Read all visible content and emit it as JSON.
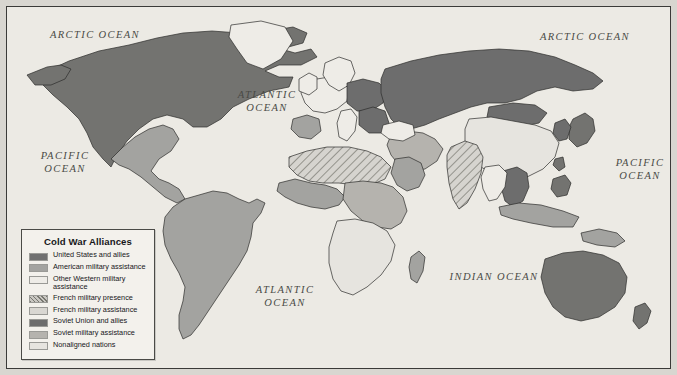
{
  "map": {
    "title": "Cold War Alliances",
    "ocean_labels": [
      {
        "name": "arctic-ocean-west",
        "text": "ARCTIC OCEAN",
        "x": 28,
        "y": 22,
        "w": 120
      },
      {
        "name": "arctic-ocean-east",
        "text": "ARCTIC OCEAN",
        "x": 518,
        "y": 24,
        "w": 120
      },
      {
        "name": "atlantic-ocean-north",
        "text": "ATLANTIC\nOCEAN",
        "x": 213,
        "y": 82,
        "w": 94
      },
      {
        "name": "pacific-ocean-west",
        "text": "PACIFIC\nOCEAN",
        "x": 22,
        "y": 143,
        "w": 72
      },
      {
        "name": "pacific-ocean-east",
        "text": "PACIFIC\nOCEAN",
        "x": 597,
        "y": 150,
        "w": 72
      },
      {
        "name": "atlantic-ocean-south",
        "text": "ATLANTIC\nOCEAN",
        "x": 234,
        "y": 277,
        "w": 88
      },
      {
        "name": "indian-ocean",
        "text": "INDIAN OCEAN",
        "x": 432,
        "y": 264,
        "w": 110
      }
    ],
    "legend": [
      {
        "label": "United States and allies",
        "color": "#707070",
        "pattern": "solid"
      },
      {
        "label": "American military assistance",
        "color": "#a3a3a0",
        "pattern": "solid"
      },
      {
        "label": "Other Western military assistance",
        "color": "#eeece7",
        "pattern": "solid"
      },
      {
        "label": "French military presence",
        "color": "#c9c7c2",
        "pattern": "hatch"
      },
      {
        "label": "French military assistance",
        "color": "#d9d7d2",
        "pattern": "solid"
      },
      {
        "label": "Soviet Union and allies",
        "color": "#6d6d6d",
        "pattern": "solid"
      },
      {
        "label": "Soviet military assistance",
        "color": "#b5b3ae",
        "pattern": "solid"
      },
      {
        "label": "Nonaligned nations",
        "color": "#e6e4df",
        "pattern": "solid"
      }
    ],
    "colors": {
      "ocean": "#eceae4",
      "us_allies": "#737370",
      "american_assistance": "#a3a3a0",
      "other_western": "#eeece7",
      "french_presence": "#c9c7c2",
      "french_assistance": "#d9d7d2",
      "soviet_allies": "#6d6d6d",
      "soviet_assistance": "#b5b3ae",
      "nonaligned": "#e6e4df",
      "border": "#3a3a38",
      "coast": "#2d2d2b"
    },
    "regions": [
      {
        "name": "north-america-usa-canada",
        "fill": "us_allies",
        "d": "M36 66 L62 54 L92 44 L122 38 L150 31 L176 26 L205 24 L232 26 L250 31 L262 24 L286 20 L300 26 L296 36 L274 42 L288 46 L304 42 L310 50 L294 58 L272 58 L258 64 L272 70 L286 70 L282 80 L262 84 L242 92 L226 100 L214 112 L200 120 L186 120 L176 112 L160 108 L146 112 L132 122 L120 134 L110 148 L104 160 L96 152 L86 140 L80 126 L72 112 L60 100 L46 88 L34 76 Z"
      },
      {
        "name": "alaska-panhandle",
        "fill": "us_allies",
        "d": "M20 68 L40 60 L54 58 L64 62 L58 72 L44 78 L28 78 Z"
      },
      {
        "name": "greenland",
        "fill": "other_western",
        "d": "M224 18 L254 14 L278 20 L286 34 L274 52 L256 62 L240 56 L230 42 L222 30 Z"
      },
      {
        "name": "mexico-centam",
        "fill": "american_assistance",
        "d": "M104 152 L116 140 L128 130 L142 122 L156 118 L166 122 L172 132 L164 144 L152 152 L144 164 L152 172 L162 176 L172 182 L178 192 L170 196 L158 190 L146 180 L134 170 L122 162 L112 158 Z"
      },
      {
        "name": "south-america",
        "fill": "american_assistance",
        "d": "M178 192 L192 188 L206 184 L220 186 L232 192 L242 196 L250 192 L258 196 L254 206 L246 216 L244 230 L240 244 L232 258 L224 270 L216 282 L208 294 L200 306 L192 318 L184 328 L176 332 L172 322 L172 308 L176 294 L178 280 L172 266 L164 252 L158 238 L156 224 L158 210 L166 200 Z"
      },
      {
        "name": "africa-north-hatched",
        "fill": "french_presence",
        "hatch": true,
        "d": "M282 150 L300 144 L320 140 L342 140 L360 144 L374 150 L384 160 L378 172 L364 178 L348 178 L332 176 L316 176 L302 174 L290 168 L282 160 Z"
      },
      {
        "name": "africa-west",
        "fill": "american_assistance",
        "d": "M272 176 L288 172 L304 176 L318 178 L330 182 L338 190 L332 198 L318 202 L304 200 L290 196 L278 190 L270 184 Z"
      },
      {
        "name": "africa-central-east",
        "fill": "soviet_assistance",
        "d": "M338 176 L356 174 L374 176 L386 180 L396 190 L400 204 L394 216 L384 222 L370 220 L356 214 L344 204 L336 192 Z"
      },
      {
        "name": "africa-south",
        "fill": "nonaligned",
        "d": "M330 214 L348 212 L366 216 L380 224 L388 238 L384 254 L374 268 L360 280 L346 288 L334 284 L326 272 L322 256 L322 240 L326 226 Z"
      },
      {
        "name": "madagascar",
        "fill": "american_assistance",
        "d": "M404 250 L412 244 L418 250 L416 264 L410 276 L404 272 L402 260 Z"
      },
      {
        "name": "europe-west",
        "fill": "other_western",
        "d": "M296 78 L310 72 L322 70 L334 74 L342 82 L340 94 L330 102 L318 106 L306 104 L298 96 L294 86 Z"
      },
      {
        "name": "iberia",
        "fill": "american_assistance",
        "d": "M286 112 L300 108 L312 112 L314 124 L304 132 L292 130 L284 122 Z"
      },
      {
        "name": "scandinavia",
        "fill": "other_western",
        "d": "M318 56 L332 50 L344 54 L348 66 L342 78 L332 84 L322 78 L316 68 Z"
      },
      {
        "name": "britain-ireland",
        "fill": "other_western",
        "d": "M292 72 L302 66 L310 70 L310 82 L302 88 L292 84 Z"
      },
      {
        "name": "central-europe-soviet-bloc",
        "fill": "soviet_allies",
        "d": "M340 76 L356 72 L372 76 L380 84 L376 96 L364 104 L350 104 L340 96 Z"
      },
      {
        "name": "balkans",
        "fill": "soviet_allies",
        "d": "M352 104 L366 100 L378 104 L382 116 L374 126 L362 126 L352 118 Z"
      },
      {
        "name": "italy",
        "fill": "other_western",
        "d": "M334 104 L344 102 L350 110 L348 124 L340 134 L332 130 L330 116 Z"
      },
      {
        "name": "soviet-union",
        "fill": "soviet_allies",
        "d": "M378 62 L404 54 L432 48 L462 44 L492 42 L522 44 L548 50 L568 58 L586 66 L596 74 L586 82 L566 84 L548 80 L530 84 L514 92 L498 96 L480 96 L464 100 L448 106 L432 112 L418 118 L404 122 L392 120 L384 112 L378 100 L374 86 L374 72 Z"
      },
      {
        "name": "mongolia",
        "fill": "soviet_allies",
        "d": "M482 100 L506 96 L528 98 L540 106 L532 116 L512 120 L492 118 L480 110 Z"
      },
      {
        "name": "china",
        "fill": "nonaligned",
        "d": "M462 112 L484 110 L506 114 L528 118 L544 124 L552 136 L548 150 L536 162 L520 170 L504 172 L488 168 L474 160 L464 148 L458 134 L458 122 Z"
      },
      {
        "name": "india-hatched",
        "fill": "french_presence",
        "hatch": true,
        "d": "M444 140 L458 134 L470 138 L476 150 L474 166 L468 182 L460 196 L452 202 L446 192 L442 176 L440 160 L440 148 Z"
      },
      {
        "name": "middle-east",
        "fill": "soviet_assistance",
        "d": "M384 128 L400 124 L416 126 L428 132 L436 142 L430 154 L418 162 L404 164 L392 158 L384 148 L380 138 Z"
      },
      {
        "name": "arabia",
        "fill": "american_assistance",
        "d": "M388 152 L402 150 L414 156 L418 168 L412 180 L400 184 L390 178 L384 166 Z"
      },
      {
        "name": "turkey",
        "fill": "other_western",
        "d": "M376 118 L392 114 L406 118 L408 128 L396 134 L382 132 L374 126 Z"
      },
      {
        "name": "indochina",
        "fill": "soviet_allies",
        "d": "M496 164 L510 160 L520 166 L522 180 L516 194 L506 200 L498 194 L494 180 Z"
      },
      {
        "name": "thailand-burma",
        "fill": "other_western",
        "d": "M478 160 L492 158 L500 166 L498 180 L490 192 L482 194 L476 182 L474 170 Z"
      },
      {
        "name": "malay-indonesia",
        "fill": "american_assistance",
        "d": "M492 200 L512 196 L534 198 L556 204 L572 210 L566 220 L546 220 L524 216 L506 212 L494 208 Z"
      },
      {
        "name": "philippines",
        "fill": "us_allies",
        "d": "M546 172 L558 168 L564 176 L560 188 L550 190 L544 182 Z"
      },
      {
        "name": "japan",
        "fill": "us_allies",
        "d": "M566 112 L578 106 L586 112 L588 124 L580 136 L570 140 L562 132 L562 120 Z"
      },
      {
        "name": "korea",
        "fill": "soviet_allies",
        "d": "M548 116 L558 112 L564 120 L560 132 L552 134 L546 126 Z"
      },
      {
        "name": "australia",
        "fill": "us_allies",
        "d": "M538 252 L556 246 L576 244 L596 248 L612 256 L620 270 L618 286 L608 300 L592 310 L574 314 L558 310 L546 300 L538 286 L534 270 Z"
      },
      {
        "name": "new-zealand",
        "fill": "us_allies",
        "d": "M628 300 L638 296 L644 304 L640 316 L632 322 L626 314 Z"
      },
      {
        "name": "new-guinea",
        "fill": "american_assistance",
        "d": "M574 226 L592 222 L610 226 L618 234 L608 240 L590 238 L576 234 Z"
      },
      {
        "name": "taiwan",
        "fill": "us_allies",
        "d": "M548 152 L556 150 L558 160 L552 164 L546 158 Z"
      }
    ]
  }
}
